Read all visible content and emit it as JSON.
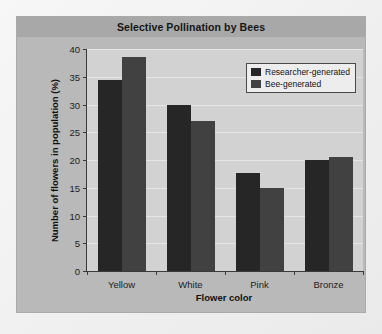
{
  "chart_data": {
    "type": "bar",
    "title": "Selective Pollination by Bees",
    "xlabel": "Flower color",
    "ylabel": "Number of flowers in population (%)",
    "categories": [
      "Yellow",
      "White",
      "Pink",
      "Bronze"
    ],
    "series": [
      {
        "name": "Researcher-generated",
        "color": "#262626",
        "values": [
          34.5,
          30.0,
          17.7,
          20.0
        ]
      },
      {
        "name": "Bee-generated",
        "color": "#414141",
        "values": [
          38.5,
          27.0,
          15.0,
          20.5
        ]
      }
    ],
    "ylim": [
      0,
      40
    ],
    "yticks": [
      0,
      5,
      10,
      15,
      20,
      25,
      30,
      35,
      40
    ],
    "ytick_labels": [
      "0",
      "5",
      "10",
      "15",
      "20",
      "25",
      "30",
      "35",
      "40"
    ],
    "grid": true,
    "legend_position": "top-right",
    "plot_background": "#d2d2d2",
    "panel_background": "#b9b9b9",
    "title_band_background": "#a8a8a8"
  }
}
